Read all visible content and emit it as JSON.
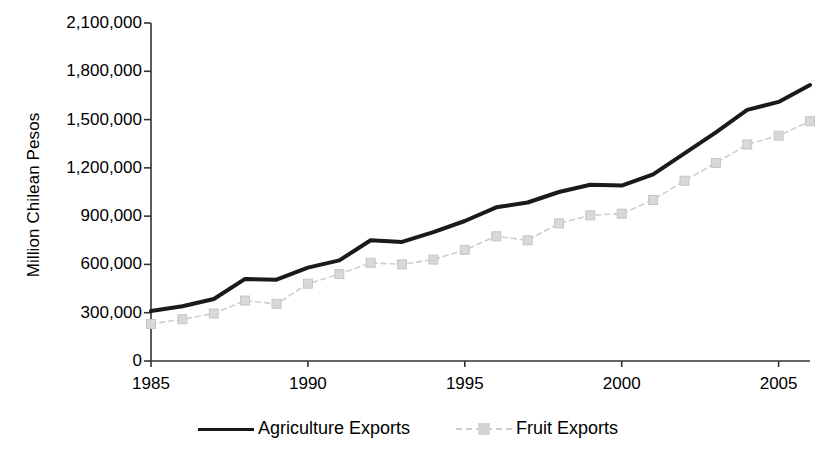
{
  "chart_data": {
    "type": "line",
    "title": "",
    "xlabel": "",
    "ylabel": "Million Chilean Pesos",
    "x": [
      1985,
      1986,
      1987,
      1988,
      1989,
      1990,
      1991,
      1992,
      1993,
      1994,
      1995,
      1996,
      1997,
      1998,
      1999,
      2000,
      2001,
      2002,
      2003,
      2004,
      2005,
      2006
    ],
    "xlim": [
      1985,
      2006
    ],
    "ylim": [
      0,
      2100000
    ],
    "grid": false,
    "legend_position": "bottom",
    "y_tick_labels": [
      "2,100,000",
      "1,800,000",
      "1,500,000",
      "1,200,000",
      "900,000",
      "600,000",
      "300,000",
      "0"
    ],
    "y_tick_values": [
      2100000,
      1800000,
      1500000,
      1200000,
      900000,
      600000,
      300000,
      0
    ],
    "x_tick_labels": [
      "1985",
      "1990",
      "1995",
      "2000",
      "2005"
    ],
    "x_tick_values": [
      1985,
      1990,
      1995,
      2000,
      2005
    ],
    "series": [
      {
        "name": "Agriculture Exports",
        "color": "#1a1a1a",
        "style": "solid",
        "marker": "none",
        "values": [
          310000,
          340000,
          385000,
          510000,
          505000,
          580000,
          625000,
          750000,
          740000,
          800000,
          870000,
          955000,
          985000,
          1050000,
          1095000,
          1090000,
          1160000,
          1290000,
          1420000,
          1560000,
          1610000,
          1715000
        ]
      },
      {
        "name": "Fruit Exports",
        "color": "#cfcfcf",
        "style": "dashed",
        "marker": "square",
        "values": [
          230000,
          260000,
          295000,
          375000,
          355000,
          480000,
          540000,
          610000,
          600000,
          630000,
          690000,
          775000,
          750000,
          855000,
          905000,
          915000,
          1000000,
          1120000,
          1230000,
          1345000,
          1400000,
          1490000
        ]
      }
    ]
  },
  "legend": {
    "items": [
      {
        "label": "Agriculture Exports"
      },
      {
        "label": "Fruit Exports"
      }
    ]
  },
  "axis": {
    "y_title": "Million Chilean Pesos"
  }
}
